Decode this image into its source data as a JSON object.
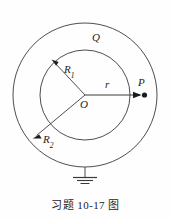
{
  "figure": {
    "caption": "习题 10-17 图",
    "background_color": "#fefefe",
    "line_color": "#3a3a3a",
    "text_color": "#1c1c1c",
    "labels": {
      "charge": "Q",
      "inner_radius": "R",
      "inner_radius_sub": "1",
      "outer_radius": "R",
      "outer_radius_sub": "2",
      "field_point_distance": "r",
      "center": "O",
      "field_point": "P"
    },
    "geometry": {
      "center_x": 85,
      "center_y": 95,
      "inner_radius_px": 45,
      "outer_radius_px": 72,
      "ground_symbol": "earth-ground",
      "ground_stem_top_y": 167,
      "ground_stem_bottom_y": 177
    }
  }
}
